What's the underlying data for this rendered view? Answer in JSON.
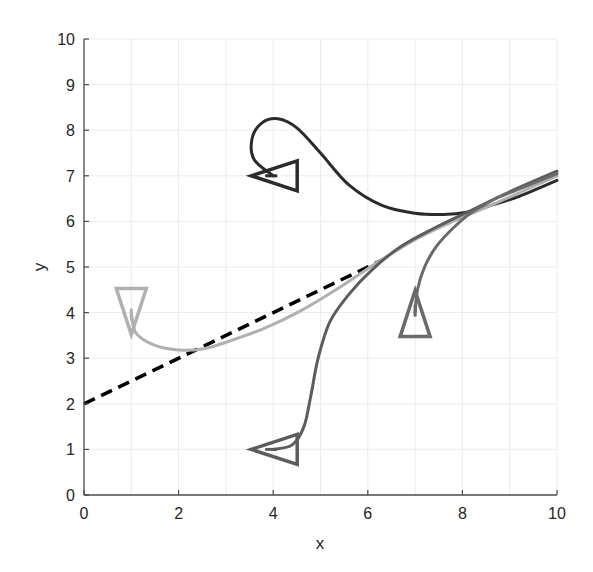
{
  "chart_data": {
    "type": "line",
    "title": "",
    "xlabel": "x",
    "ylabel": "y",
    "xlim": [
      0,
      10
    ],
    "ylim": [
      0,
      10
    ],
    "xticks": [
      "0",
      "2",
      "4",
      "6",
      "8",
      "10"
    ],
    "yticks": [
      "0",
      "1",
      "2",
      "3",
      "4",
      "5",
      "6",
      "7",
      "8",
      "9",
      "10"
    ],
    "grid": true,
    "legend": null,
    "reference_line": {
      "name": "target-path",
      "style": "dashed",
      "color": "#000000",
      "x": [
        0,
        6.3
      ],
      "y": [
        2,
        5.15
      ]
    },
    "series": [
      {
        "name": "trajectory-1",
        "color": "#2b2b2b",
        "start_pose": {
          "x": 4.0,
          "y": 7.0,
          "heading": "right"
        },
        "x": [
          4.0,
          3.6,
          3.55,
          3.75,
          4.1,
          4.5,
          5.0,
          5.6,
          6.3,
          7.0,
          7.6,
          8.1,
          8.6,
          9.2,
          10.0
        ],
        "y": [
          7.0,
          7.35,
          7.8,
          8.15,
          8.25,
          8.05,
          7.5,
          6.8,
          6.35,
          6.18,
          6.15,
          6.2,
          6.35,
          6.55,
          6.9
        ]
      },
      {
        "name": "trajectory-2",
        "color": "#b0b0b0",
        "start_pose": {
          "x": 1.0,
          "y": 4.0,
          "heading": "down"
        },
        "x": [
          1.0,
          1.1,
          1.5,
          2.0,
          2.5,
          3.0,
          3.8,
          4.6,
          5.4,
          6.2,
          7.0,
          7.8,
          8.6,
          10.0
        ],
        "y": [
          4.0,
          3.55,
          3.28,
          3.18,
          3.2,
          3.35,
          3.65,
          4.05,
          4.55,
          5.1,
          5.6,
          6.0,
          6.35,
          7.0
        ]
      },
      {
        "name": "trajectory-3",
        "color": "#5c5c5c",
        "start_pose": {
          "x": 4.0,
          "y": 1.0,
          "heading": "right"
        },
        "x": [
          4.0,
          4.4,
          4.65,
          4.8,
          4.95,
          5.2,
          5.6,
          6.1,
          6.7,
          7.4,
          8.2,
          9.0,
          10.0
        ],
        "y": [
          1.0,
          1.1,
          1.5,
          2.2,
          3.0,
          3.8,
          4.4,
          4.95,
          5.45,
          5.85,
          6.25,
          6.65,
          7.1
        ]
      },
      {
        "name": "trajectory-4",
        "color": "#6a6a6a",
        "start_pose": {
          "x": 7.0,
          "y": 4.0,
          "heading": "up"
        },
        "x": [
          7.0,
          7.05,
          7.2,
          7.45,
          7.8,
          8.2,
          8.7,
          9.3,
          10.0
        ],
        "y": [
          4.0,
          4.5,
          5.0,
          5.45,
          5.85,
          6.2,
          6.5,
          6.75,
          7.05
        ]
      }
    ]
  }
}
